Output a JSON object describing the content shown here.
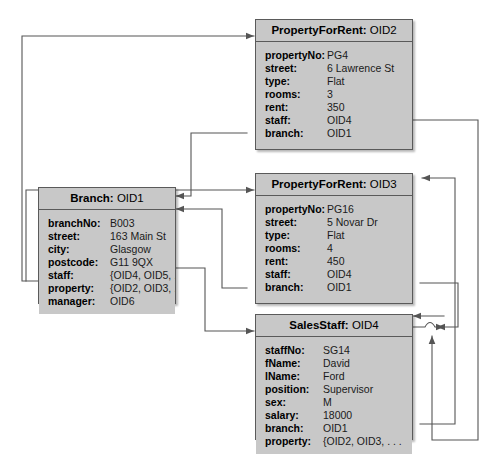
{
  "diagram": {
    "background_color": "#ffffff",
    "box_fill_color": "#c8c8c8",
    "box_border_color": "#5a5a5a",
    "connector_color": "#555555"
  },
  "objects": [
    {
      "id": "property-oid2",
      "class_name": "PropertyForRent:",
      "oid": "OID2",
      "attributes": [
        {
          "name": "propertyNo:",
          "value": "PG4"
        },
        {
          "name": "street:",
          "value": "6 Lawrence St"
        },
        {
          "name": "type:",
          "value": "Flat"
        },
        {
          "name": "rooms:",
          "value": "3"
        },
        {
          "name": "rent:",
          "value": "350"
        },
        {
          "name": "staff:",
          "value": "OID4"
        },
        {
          "name": "branch:",
          "value": "OID1"
        }
      ]
    },
    {
      "id": "property-oid3",
      "class_name": "PropertyForRent:",
      "oid": "OID3",
      "attributes": [
        {
          "name": "propertyNo:",
          "value": "PG16"
        },
        {
          "name": "street:",
          "value": "5 Novar Dr"
        },
        {
          "name": "type:",
          "value": "Flat"
        },
        {
          "name": "rooms:",
          "value": "4"
        },
        {
          "name": "rent:",
          "value": "450"
        },
        {
          "name": "staff:",
          "value": "OID4"
        },
        {
          "name": "branch:",
          "value": "OID1"
        }
      ]
    },
    {
      "id": "branch-oid1",
      "class_name": "Branch:",
      "oid": "OID1",
      "attributes": [
        {
          "name": "branchNo:",
          "value": "B003"
        },
        {
          "name": "street:",
          "value": "163 Main St"
        },
        {
          "name": "city:",
          "value": "Glasgow"
        },
        {
          "name": "postcode:",
          "value": "G11 9QX"
        },
        {
          "name": "staff:",
          "value": "{OID4, OID5, . . . }"
        },
        {
          "name": "property:",
          "value": "{OID2, OID3, . . . }"
        },
        {
          "name": "manager:",
          "value": "OID6"
        }
      ]
    },
    {
      "id": "salesstaff-oid4",
      "class_name": "SalesStaff:",
      "oid": "OID4",
      "attributes": [
        {
          "name": "staffNo:",
          "value": "SG14"
        },
        {
          "name": "fName:",
          "value": "David"
        },
        {
          "name": "lName:",
          "value": "Ford"
        },
        {
          "name": "position:",
          "value": "Supervisor"
        },
        {
          "name": "sex:",
          "value": "M"
        },
        {
          "name": "salary:",
          "value": "18000"
        },
        {
          "name": "branch:",
          "value": "OID1"
        },
        {
          "name": "property:",
          "value": "{OID2, OID3, . . ."
        }
      ]
    }
  ]
}
